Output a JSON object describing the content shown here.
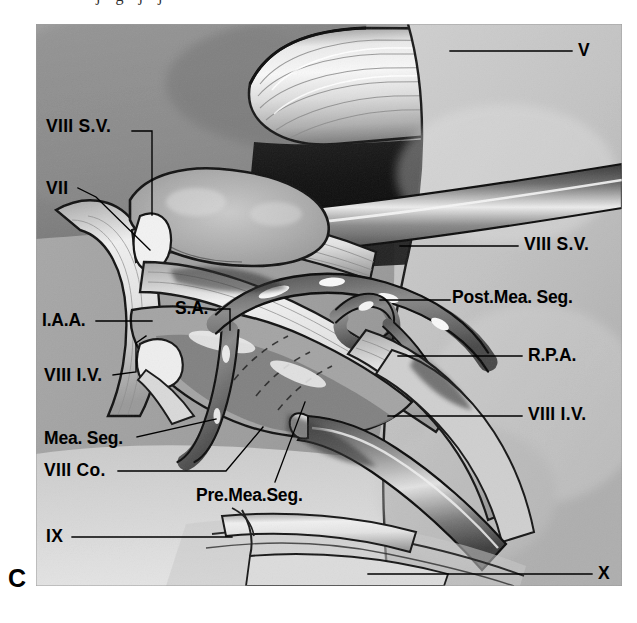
{
  "figure": {
    "panel_letter": "C",
    "top_cut_text": "j g j j",
    "caption_visible": false
  },
  "plate": {
    "kind": "surgical-anatomy-photograph",
    "subject": "cerebellopontine angle and internal acoustic meatus dissection",
    "background_color": "#b9b9b7",
    "dark_region_color": "#1d1d1d",
    "instrument_color": "#6e6e6e",
    "nerve_color": "#e4e0d8",
    "artery_color": "#7a7a7a"
  },
  "labels": [
    {
      "id": "viii-sv-left",
      "text": "VIII S.V.",
      "style": "roman",
      "x": 46,
      "y": 118,
      "anchor": "right",
      "leader": "elbow-right-down",
      "leader_path": "M 132 131 L 152 131 L 152 215"
    },
    {
      "id": "vii",
      "text": "VII",
      "style": "roman",
      "x": 46,
      "y": 180,
      "anchor": "right",
      "leader": "diagonal",
      "leader_path": "M 78 188 L 96 197 L 150 250"
    },
    {
      "id": "iaa",
      "text": "I.A.A.",
      "style": "plain",
      "x": 42,
      "y": 312,
      "anchor": "right",
      "leader": "straight",
      "leader_path": "M 96 321 L 152 321"
    },
    {
      "id": "sa",
      "text": "S.A.",
      "style": "plain",
      "x": 175,
      "y": 300,
      "anchor": "right",
      "leader": "elbow-right-down",
      "leader_path": "M 218 309 L 230 309 L 230 330"
    },
    {
      "id": "viii-iv-left",
      "text": "VIII I.V.",
      "style": "roman",
      "x": 44,
      "y": 367,
      "anchor": "right",
      "leader": "elbow",
      "leader_path": "M 113 375 L 136 372 L 136 343 L 146 336"
    },
    {
      "id": "mea-seg",
      "text": "Mea. Seg.",
      "style": "plain",
      "x": 44,
      "y": 430,
      "anchor": "right",
      "leader": "straight",
      "leader_path": "M 137 437 L 216 419"
    },
    {
      "id": "viii-co",
      "text": "VIII Co.",
      "style": "roman",
      "x": 44,
      "y": 462,
      "anchor": "right",
      "leader": "elbow-up",
      "leader_path": "M 118 471 L 226 471 L 263 427"
    },
    {
      "id": "pre-mea-seg",
      "text": "Pre.Mea.Seg.",
      "style": "plain",
      "x": 196,
      "y": 487,
      "anchor": "right",
      "leader": "diagonal-up",
      "leader_path": "M 275 482 L 305 402"
    },
    {
      "id": "ix",
      "text": "IX",
      "style": "roman",
      "x": 46,
      "y": 528,
      "anchor": "right",
      "leader": "straight",
      "leader_path": "M 72 537 L 232 537"
    },
    {
      "id": "v",
      "text": "V",
      "style": "roman",
      "x": 578,
      "y": 42,
      "anchor": "left",
      "leader": "straight",
      "leader_path": "M 572 51 L 450 51"
    },
    {
      "id": "viii-sv-right",
      "text": "VIII S.V.",
      "style": "roman",
      "x": 524,
      "y": 236,
      "anchor": "left",
      "leader": "straight",
      "leader_path": "M 518 246 L 400 246"
    },
    {
      "id": "post-mea-seg",
      "text": "Post.Mea. Seg.",
      "style": "plain",
      "x": 452,
      "y": 289,
      "anchor": "left",
      "leader": "straight",
      "leader_path": "M 450 300 L 380 300"
    },
    {
      "id": "rpa",
      "text": "R.P.A.",
      "style": "plain",
      "x": 528,
      "y": 347,
      "anchor": "left",
      "leader": "straight",
      "leader_path": "M 522 356 L 398 356"
    },
    {
      "id": "viii-iv-right",
      "text": "VIII I.V.",
      "style": "roman",
      "x": 528,
      "y": 406,
      "anchor": "left",
      "leader": "straight",
      "leader_path": "M 522 416 L 388 416"
    },
    {
      "id": "x",
      "text": "X",
      "style": "roman",
      "x": 598,
      "y": 565,
      "anchor": "left",
      "leader": "straight",
      "leader_path": "M 592 574 L 368 574"
    }
  ]
}
